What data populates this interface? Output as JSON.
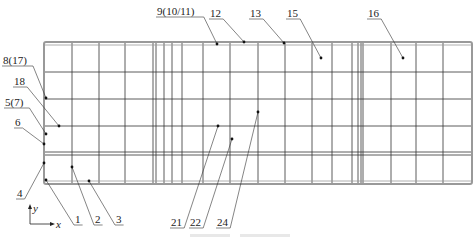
{
  "figure": {
    "type": "finite-element mesh / measurement point layout (plan view)",
    "caption_visible": false,
    "colors": {
      "grid_line": "#333333",
      "frame_line": "#999999",
      "leader": "#333333",
      "point": "#111111"
    }
  },
  "mesh": {
    "outer_frame": {
      "x": 44,
      "y": 42,
      "w": 428,
      "h": 142
    },
    "vertical_lines_x": [
      72,
      99,
      125,
      153,
      156,
      164,
      172,
      182,
      203,
      230,
      258,
      285,
      312,
      332,
      352,
      358,
      361,
      363,
      391,
      416,
      443
    ],
    "horizontal_lines_y": [
      72,
      99,
      126,
      152,
      155
    ]
  },
  "axes": {
    "x_label": "x",
    "y_label": "y"
  },
  "labels": [
    {
      "id": "l1",
      "text": "1",
      "tx": 75,
      "ty": 223,
      "px": 46,
      "py": 180
    },
    {
      "id": "l2",
      "text": "2",
      "tx": 95,
      "ty": 223,
      "px": 72,
      "py": 167
    },
    {
      "id": "l3",
      "text": "3",
      "tx": 116,
      "ty": 223,
      "px": 89,
      "py": 181
    },
    {
      "id": "l4",
      "text": "4",
      "tx": 17,
      "ty": 197,
      "px": 44,
      "py": 163
    },
    {
      "id": "l5",
      "text": "5(7)",
      "tx": 5,
      "ty": 106,
      "px": 46,
      "py": 134
    },
    {
      "id": "l6",
      "text": "6",
      "tx": 15,
      "ty": 126,
      "px": 44,
      "py": 144
    },
    {
      "id": "l8",
      "text": "8(17)",
      "tx": 3,
      "ty": 64,
      "px": 46,
      "py": 98
    },
    {
      "id": "l18",
      "text": "18",
      "tx": 14,
      "ty": 85,
      "px": 59,
      "py": 126
    },
    {
      "id": "l9",
      "text": "9(10/11)",
      "tx": 157,
      "ty": 15,
      "px": 217,
      "py": 44
    },
    {
      "id": "l12",
      "text": "12",
      "tx": 210,
      "ty": 17,
      "px": 244,
      "py": 42
    },
    {
      "id": "l13",
      "text": "13",
      "tx": 250,
      "ty": 17,
      "px": 284,
      "py": 43
    },
    {
      "id": "l15",
      "text": "15",
      "tx": 287,
      "ty": 17,
      "px": 321,
      "py": 58
    },
    {
      "id": "l16",
      "text": "16",
      "tx": 368,
      "ty": 17,
      "px": 403,
      "py": 58
    },
    {
      "id": "l21",
      "text": "21",
      "tx": 171,
      "ty": 226,
      "px": 218,
      "py": 126
    },
    {
      "id": "l22",
      "text": "22",
      "tx": 190,
      "ty": 226,
      "px": 232,
      "py": 139
    },
    {
      "id": "l24",
      "text": "24",
      "tx": 217,
      "ty": 226,
      "px": 258,
      "py": 112
    }
  ]
}
